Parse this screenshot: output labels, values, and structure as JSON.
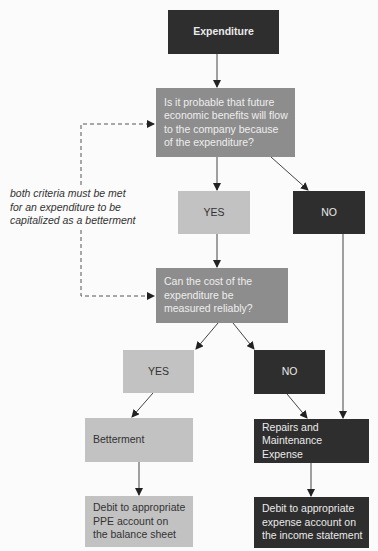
{
  "diagram": {
    "type": "flowchart",
    "nodes": {
      "start": {
        "label": "Expenditure"
      },
      "question1": {
        "label": "Is it probable that future\neconomic benefits will flow\nto the company because\nof the expenditure?"
      },
      "q1_yes": {
        "label": "YES"
      },
      "q1_no": {
        "label": "NO"
      },
      "question2": {
        "label": "Can the cost of the\nexpenditure be\nmeasured reliably?"
      },
      "q2_yes": {
        "label": "YES"
      },
      "q2_no": {
        "label": "NO"
      },
      "betterment": {
        "label": "Betterment"
      },
      "repairs": {
        "label": "Repairs and\nMaintenance Expense"
      },
      "debit_ppe": {
        "label": "Debit to appropriate\nPPE account on\nthe balance sheet"
      },
      "debit_expense": {
        "label": "Debit to appropriate\nexpense account on\nthe income statement"
      }
    },
    "annotation": "both criteria must be met\nfor an expenditure to be\ncapitalized as a betterment",
    "colors": {
      "dark": "#2e2e2e",
      "mid": "#8d8d8d",
      "light": "#c2c2c2",
      "line": "#444444"
    }
  }
}
